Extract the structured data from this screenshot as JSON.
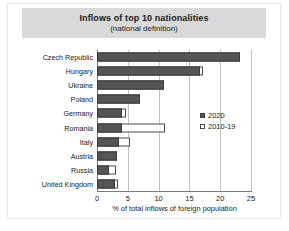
{
  "figure": {
    "title": "Inflows of top 10 nationalities",
    "subtitle": "(national definition)"
  },
  "legend": {
    "items": [
      {
        "label": "2020",
        "style": "solid",
        "color": "#555555"
      },
      {
        "label": "2010-19",
        "style": "open",
        "color": "#ffffff"
      }
    ]
  },
  "axis": {
    "xlabel": "% of total inflows of foreign population",
    "xticks": [
      "0",
      "5",
      "10",
      "15",
      "20",
      "25"
    ]
  },
  "chart_data": {
    "type": "bar",
    "orientation": "horizontal",
    "title": "Inflows of top 10 nationalities",
    "subtitle": "(national definition)",
    "xlabel": "% of total inflows of foreign population",
    "ylabel": "",
    "xlim": [
      0,
      25
    ],
    "xticks": [
      0,
      5,
      10,
      15,
      20,
      25
    ],
    "grid": true,
    "legend_position": "inside-right",
    "categories": [
      "Czech Republic",
      "Hungary",
      "Ukraine",
      "Poland",
      "Germany",
      "Romania",
      "Italy",
      "Austria",
      "Russia",
      "United Kingdom"
    ],
    "series": [
      {
        "name": "2020",
        "style": "solid",
        "color": "#555555",
        "values": [
          23.2,
          16.8,
          10.8,
          7.0,
          4.0,
          4.0,
          3.5,
          3.2,
          1.9,
          3.0
        ]
      },
      {
        "name": "2010-19",
        "style": "open",
        "color": "#ffffff",
        "values": [
          23.2,
          17.2,
          10.8,
          7.0,
          4.7,
          11.0,
          5.3,
          3.2,
          3.1,
          3.4
        ]
      }
    ]
  }
}
